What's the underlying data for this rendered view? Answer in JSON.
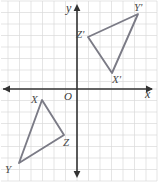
{
  "figure": {
    "width": 158,
    "height": 182
  },
  "colors": {
    "background": "#ffffff",
    "grid": "#d9d9d9",
    "axis": "#333333",
    "shape_stroke": "#7b7b86",
    "label_text": "#4a4a4a"
  },
  "axes": {
    "x_label": "x",
    "y_label": "y",
    "origin_label": "O",
    "x_axis_pixel_y": 89,
    "y_axis_pixel_x": 77,
    "grid_step_px": 11.5,
    "grid_visible": true
  },
  "chart_data": {
    "type": "scatter",
    "xlabel": "x",
    "ylabel": "y",
    "xlim": [
      -6.7,
      7.0
    ],
    "ylim": [
      -7.2,
      7.7
    ],
    "grid": true,
    "legend": "none",
    "series": [
      {
        "name": "Triangle XYZ",
        "closed": true,
        "points": [
          {
            "label": "X",
            "x": -3.0,
            "y": 1.0,
            "px": 42,
            "py": 100,
            "label_px": 31,
            "label_py": 94
          },
          {
            "label": "Y",
            "x": -5.0,
            "y": -6.4,
            "px": 19,
            "py": 163,
            "label_px": 5,
            "label_py": 164
          },
          {
            "label": "Z",
            "x": -1.1,
            "y": -4.0,
            "px": 64,
            "py": 135,
            "label_px": 63,
            "label_py": 137
          }
        ]
      },
      {
        "name": "Triangle X'Y'Z'",
        "closed": true,
        "points": [
          {
            "label": "X'",
            "x": 3.0,
            "y": 1.4,
            "px": 112,
            "py": 73,
            "label_px": 112,
            "label_py": 74
          },
          {
            "label": "Y'",
            "x": 5.3,
            "y": 6.5,
            "px": 138,
            "py": 14,
            "label_px": 134,
            "label_py": 2
          },
          {
            "label": "Z'",
            "x": 1.0,
            "y": 4.5,
            "px": 88,
            "py": 37,
            "label_px": 76,
            "label_py": 29
          }
        ]
      }
    ]
  },
  "labels": {
    "x_vertex": "X",
    "y_vertex": "Y",
    "z_vertex": "Z",
    "x_prime_vertex": "X'",
    "y_prime_vertex": "Y'",
    "z_prime_vertex": "Z'"
  }
}
